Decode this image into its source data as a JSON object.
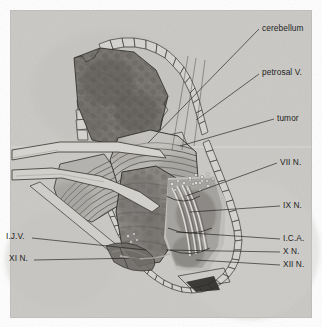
{
  "figure": {
    "type": "surgical-anatomy-illustration",
    "style": "grayscale pen-and-ink halftone scan",
    "page_background": "#ffffff",
    "plate_background": "#c9c8c4",
    "ink_color": "#1d1d1d"
  },
  "labels": {
    "cerebellum": "cerebellum",
    "petrosal_v": "petrosal V.",
    "tumor": "tumor",
    "vii_n": "VII N.",
    "ix_n": "IX N.",
    "ica": "I.C.A.",
    "x_n": "X N.",
    "xii_n": "XII N.",
    "ijv": "I.J.V.",
    "xi_n": "XI N."
  },
  "label_layout": [
    {
      "key": "cerebellum",
      "side": "right",
      "x": 262,
      "y": 28
    },
    {
      "key": "petrosal_v",
      "side": "right",
      "x": 262,
      "y": 72
    },
    {
      "key": "tumor",
      "side": "right",
      "x": 277,
      "y": 120
    },
    {
      "key": "vii_n",
      "side": "right",
      "x": 280,
      "y": 164
    },
    {
      "key": "ix_n",
      "side": "right",
      "x": 283,
      "y": 207
    },
    {
      "key": "ica",
      "side": "right",
      "x": 283,
      "y": 239
    },
    {
      "key": "x_n",
      "side": "right",
      "x": 283,
      "y": 252
    },
    {
      "key": "xii_n",
      "side": "right",
      "x": 283,
      "y": 265
    },
    {
      "key": "ijv",
      "side": "left",
      "x": 8,
      "y": 237
    },
    {
      "key": "xi_n",
      "side": "left",
      "x": 11,
      "y": 259
    }
  ],
  "anatomy_parts": [
    "craniotomy bone edge",
    "dura mater flap",
    "cerebellum with folia",
    "tumor mass",
    "retractor blades",
    "cranial nerve bundle",
    "internal jugular vein",
    "internal carotid artery"
  ]
}
